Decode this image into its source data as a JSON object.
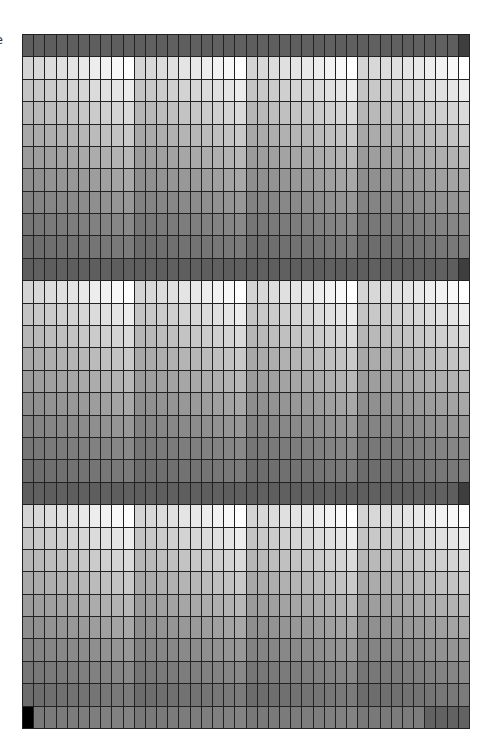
{
  "corner_label": "e",
  "grid": {
    "columns": 40,
    "rows": 31,
    "column_groups": 4,
    "group_size": 10,
    "line_color": "#222222",
    "header_rows": [
      0,
      10,
      20
    ],
    "header_gray": 94,
    "header_last_cell_gray": 62,
    "band_row_base_gray": [
      0,
      212,
      196,
      182,
      168,
      155,
      142,
      130,
      118,
      108
    ],
    "column_offset_gray": [
      0,
      4,
      8,
      12,
      16,
      20,
      25,
      30,
      36,
      43
    ],
    "final_row": {
      "index": 30,
      "gray": 120,
      "first_cell_gray": 0,
      "tail_cells": 4,
      "tail_gray": 98
    }
  }
}
